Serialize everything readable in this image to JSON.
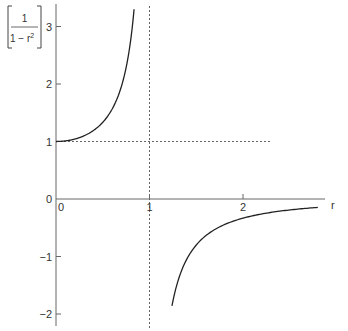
{
  "chart_data": {
    "type": "line",
    "title": "",
    "function": "1/(1 - r^2)",
    "ylabel": {
      "numerator": "1",
      "denominator_prefix": "1 − r",
      "exponent": "2"
    },
    "xlabel": "r",
    "xlim": [
      0,
      2.8
    ],
    "ylim": [
      -2.1,
      3.3
    ],
    "x_ticks": [
      {
        "value": 0,
        "label": "0"
      },
      {
        "value": 1,
        "label": "1"
      },
      {
        "value": 2,
        "label": "2"
      }
    ],
    "y_ticks": [
      {
        "value": 3,
        "label": "3"
      },
      {
        "value": 2,
        "label": "2"
      },
      {
        "value": 1,
        "label": "1"
      },
      {
        "value": 0,
        "label": "0"
      },
      {
        "value": -1,
        "label": "−1"
      },
      {
        "value": -2,
        "label": "−2"
      }
    ],
    "series": [
      {
        "name": "branch-left",
        "description": "r in [0, 0.83]",
        "x": [
          0,
          0.1,
          0.2,
          0.3,
          0.4,
          0.5,
          0.6,
          0.7,
          0.75,
          0.8,
          0.835
        ],
        "y": [
          1.0,
          1.0101,
          1.0417,
          1.0989,
          1.1905,
          1.3333,
          1.5625,
          1.9608,
          2.2857,
          2.7778,
          3.3
        ]
      },
      {
        "name": "branch-right",
        "description": "r in [1.24, 2.8]",
        "x": [
          1.24,
          1.3,
          1.4,
          1.5,
          1.6,
          1.8,
          2.0,
          2.2,
          2.4,
          2.6,
          2.8
        ],
        "y": [
          -1.8601,
          -1.4493,
          -1.0417,
          -0.8,
          -0.641,
          -0.4464,
          -0.3333,
          -0.2604,
          -0.2101,
          -0.1736,
          -0.1462
        ]
      }
    ],
    "asymptotes": [
      {
        "orientation": "vertical",
        "value": 1,
        "style": "dashed"
      },
      {
        "orientation": "horizontal",
        "value": 1,
        "style": "dashed",
        "x_range": [
          0,
          2.3
        ]
      }
    ],
    "grid": false,
    "legend": "none"
  }
}
